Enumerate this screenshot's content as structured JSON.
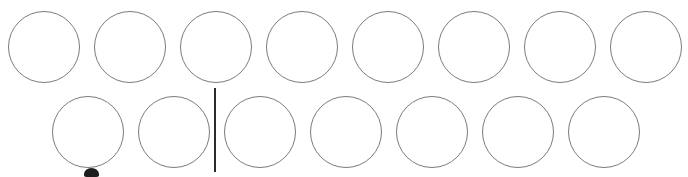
{
  "canvas": {
    "name": "handwriting-canvas",
    "width": 688,
    "height": 177,
    "background_color": "#ffffff",
    "description": "Blank white writing surface with two rows of hand-drawn circle glyphs"
  },
  "style": {
    "stroke_color": "#7b7b7b",
    "stroke_width_px": 1,
    "caret_color": "#2b2b2b",
    "fragment_color": "#1d1d1d"
  },
  "rows": [
    {
      "name": "glyph-row-1",
      "label": "Row 1",
      "top": 11,
      "glyph_diameter": 72,
      "glyph_count": 8,
      "glyph_x_positions": [
        8,
        94,
        180,
        266,
        352,
        438,
        524,
        610
      ],
      "glyph_label": "circle"
    },
    {
      "name": "glyph-row-2",
      "label": "Row 2",
      "top": 96,
      "glyph_diameter": 72,
      "glyph_count": 7,
      "glyph_x_positions": [
        52,
        138,
        224,
        310,
        396,
        482,
        568
      ],
      "glyph_label": "circle"
    }
  ],
  "caret": {
    "name": "text-caret",
    "label": "Text insertion caret",
    "x": 214,
    "y": 88,
    "width": 2,
    "height": 84,
    "visible": true
  },
  "fragment": {
    "name": "partial-glyph-fragment",
    "label": "Partially visible glyph clipped at bottom edge",
    "x": 84,
    "y": 168,
    "width": 15,
    "height": 9,
    "visible": true
  }
}
